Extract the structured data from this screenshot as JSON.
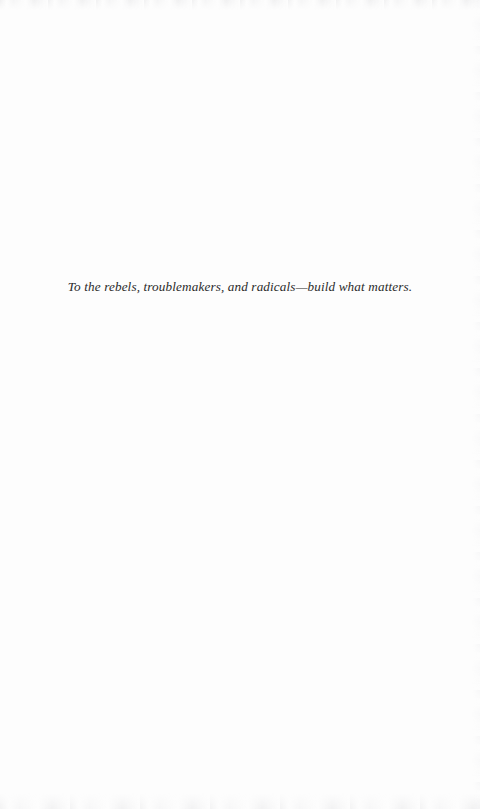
{
  "page": {
    "kind": "book-dedication-page",
    "background_color": "#fdfdfd",
    "text_color": "#2b2b2b"
  },
  "dedication": {
    "text": "To the rebels, troublemakers, and radicals—build what matters."
  }
}
